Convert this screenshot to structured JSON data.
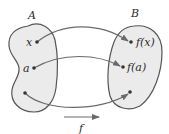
{
  "diagram": {
    "type": "function-mapping",
    "sets": [
      {
        "name": "A",
        "label": "A"
      },
      {
        "name": "B",
        "label": "B"
      }
    ],
    "domain_points": [
      {
        "id": "x",
        "label": "x"
      },
      {
        "id": "a",
        "label": "a"
      },
      {
        "id": "p",
        "label": ""
      }
    ],
    "codomain_points": [
      {
        "id": "fx",
        "label": "f(x)"
      },
      {
        "id": "fa",
        "label": "f(a)"
      },
      {
        "id": "fp",
        "label": ""
      }
    ],
    "mappings": [
      {
        "from": "x",
        "to": "fx"
      },
      {
        "from": "a",
        "to": "fa"
      },
      {
        "from": "p",
        "to": "fp"
      }
    ],
    "function_label": "f",
    "colors": {
      "set_fill": "#ebebeb",
      "set_stroke": "#555555",
      "arrow": "#6a6a6a",
      "text": "#2a2a2a"
    }
  }
}
